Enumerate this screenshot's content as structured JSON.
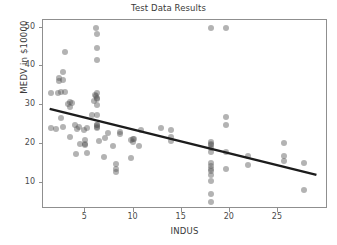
{
  "chart_data": {
    "type": "scatter",
    "title": "Test Data Results",
    "xlabel": "INDUS",
    "ylabel": "MEDV in $10000",
    "xlim": [
      0.6,
      30.2
    ],
    "ylim": [
      3.2,
      52.0
    ],
    "xticks": [
      5,
      10,
      15,
      20,
      25
    ],
    "yticks": [
      10,
      20,
      30,
      40,
      50
    ],
    "xtick_labels": [
      "5",
      "10",
      "15",
      "20",
      "25"
    ],
    "ytick_labels": [
      "10",
      "20",
      "30",
      "40",
      "50"
    ],
    "grid": false,
    "legend": null,
    "marker_color": "#5a5a5a",
    "marker_opacity": 0.46,
    "marker_size_px": 6,
    "line_color": "#1c1c1c",
    "line_width_px": 2.4,
    "axis_color": "#8f8f8f",
    "text_color": "#3a3a3a",
    "background": "#ffffff",
    "series": [
      {
        "name": "test points",
        "x": [
          1.38,
          1.47,
          1.91,
          2.18,
          2.24,
          2.31,
          2.46,
          2.46,
          2.68,
          2.68,
          2.68,
          2.89,
          2.93,
          3.24,
          3.37,
          3.41,
          3.44,
          3.64,
          3.97,
          4.05,
          4.15,
          4.39,
          4.49,
          4.86,
          4.93,
          4.95,
          4.95,
          5.13,
          5.19,
          5.64,
          5.86,
          5.96,
          6.06,
          6.09,
          6.2,
          6.2,
          6.2,
          6.2,
          6.2,
          6.2,
          6.2,
          6.2,
          6.2,
          6.2,
          6.2,
          6.2,
          6.41,
          6.91,
          7.07,
          7.38,
          7.87,
          8.14,
          8.14,
          8.14,
          8.56,
          8.56,
          9.69,
          9.69,
          9.9,
          9.9,
          10.01,
          10.59,
          10.81,
          12.83,
          13.89,
          13.92,
          13.92,
          18.1,
          18.1,
          18.1,
          18.1,
          18.1,
          18.1,
          18.1,
          18.1,
          18.1,
          18.1,
          18.1,
          18.1,
          18.1,
          18.1,
          19.58,
          19.58,
          19.58,
          19.58,
          19.58,
          21.89,
          21.89,
          25.65,
          25.65,
          25.65,
          27.74,
          27.74
        ],
        "y": [
          33.2,
          24.0,
          23.9,
          33.1,
          36.9,
          36.2,
          33.3,
          26.6,
          38.7,
          36.4,
          24.3,
          43.8,
          33.4,
          30.3,
          30.8,
          21.9,
          29.6,
          30.5,
          24.8,
          17.4,
          23.9,
          24.4,
          20.0,
          23.6,
          20.1,
          21.0,
          19.8,
          17.7,
          24.0,
          27.5,
          31.0,
          32.7,
          32.4,
          50.0,
          48.3,
          44.8,
          41.7,
          33.2,
          31.8,
          31.5,
          30.1,
          27.5,
          25.0,
          24.8,
          24.5,
          24.1,
          20.8,
          16.7,
          21.5,
          22.9,
          19.4,
          14.9,
          13.4,
          12.7,
          23.0,
          22.6,
          16.3,
          20.9,
          21.4,
          20.6,
          21.2,
          19.4,
          23.6,
          24.0,
          23.7,
          21.9,
          20.7,
          50.0,
          20.4,
          19.9,
          19.6,
          18.9,
          17.8,
          15.0,
          14.3,
          13.4,
          13.1,
          11.9,
          10.4,
          7.2,
          5.0,
          50.0,
          27.0,
          24.9,
          17.8,
          13.6,
          17.0,
          14.6,
          20.2,
          16.8,
          15.6,
          15.2,
          8.1
        ]
      }
    ],
    "trendline": {
      "name": "regression line",
      "x_start": 1.3,
      "y_start": 28.8,
      "x_end": 29.2,
      "y_end": 11.6,
      "slope": -0.616,
      "intercept": 29.6
    }
  }
}
